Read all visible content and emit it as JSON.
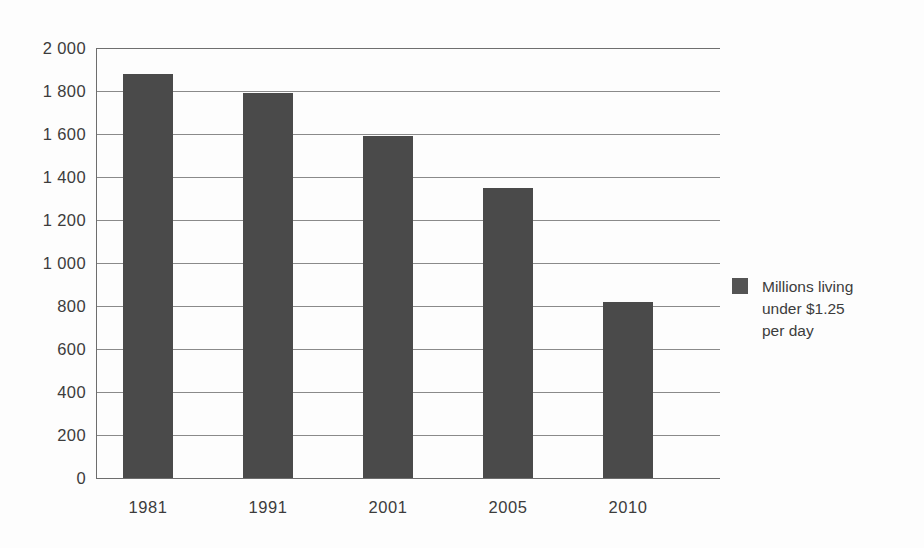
{
  "chart_data": {
    "type": "bar",
    "title": "",
    "subtitle": "",
    "xlabel": "",
    "ylabel": "",
    "categories": [
      "1981",
      "1991",
      "2001",
      "2005",
      "2010"
    ],
    "values": [
      1880,
      1790,
      1590,
      1350,
      820
    ],
    "series": [
      {
        "name": "Millions living under $1.25 per day",
        "values": [
          1880,
          1790,
          1590,
          1350,
          820
        ],
        "color": "#4a4a4a"
      }
    ],
    "ylim": [
      0,
      2000
    ],
    "ytick_step": 200,
    "ytick_labels": [
      "2 000",
      "1 800",
      "1 600",
      "1 400",
      "1 200",
      "1 000",
      "800",
      "600",
      "400",
      "200",
      "0"
    ],
    "ytick_values": [
      2000,
      1800,
      1600,
      1400,
      1200,
      1000,
      800,
      600,
      400,
      200,
      0
    ],
    "grid": true,
    "grid_axis": "y",
    "legend_position": "right",
    "annotations": []
  },
  "legend": {
    "entries": [
      {
        "swatch_color": "#545454",
        "lines": [
          "Millions living",
          "under $1.25",
          "per day"
        ]
      }
    ]
  },
  "colors": {
    "bar_fill": "#4a4a4a",
    "gridline": "#8a8a8a",
    "axis": "#6d6d6d",
    "text": "#3c3c3c",
    "background": "#fdfdfd"
  }
}
